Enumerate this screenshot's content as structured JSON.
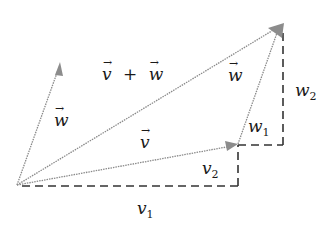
{
  "diagram": {
    "colors": {
      "vector_stroke": "#8a8a8a",
      "arrowhead": "#8c8c8c",
      "dashed": "#333333",
      "text": "#1a1a1a"
    },
    "points": {
      "origin": [
        17,
        185
      ],
      "v_tip": [
        238,
        144
      ],
      "sum_tip": [
        282,
        24
      ],
      "w_from_origin_tip": [
        60,
        63
      ]
    },
    "labels": {
      "sum": {
        "base1": "v",
        "op": "+",
        "base2": "w"
      },
      "w_left": {
        "base": "w"
      },
      "w_right": {
        "base": "w"
      },
      "v": {
        "base": "v"
      },
      "v1": {
        "base": "v",
        "sub": "1"
      },
      "v2": {
        "base": "v",
        "sub": "2"
      },
      "w1": {
        "base": "w",
        "sub": "1"
      },
      "w2": {
        "base": "w",
        "sub": "2"
      }
    }
  }
}
